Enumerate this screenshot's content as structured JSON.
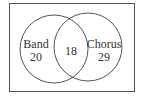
{
  "diagram": {
    "type": "venn",
    "sets": [
      {
        "label": "Band",
        "only_count": "20"
      },
      {
        "label": "Chorus",
        "only_count": "29"
      }
    ],
    "intersection": "18"
  }
}
